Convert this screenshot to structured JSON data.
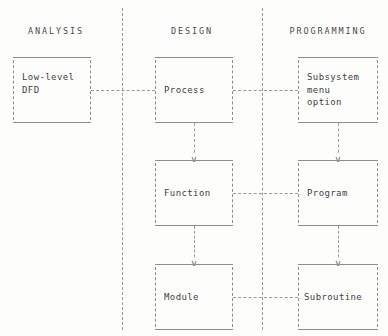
{
  "diagram": {
    "style": "ascii-art",
    "colors": {
      "background": "#fdfdfc",
      "line": "#8d8d8d",
      "dash": "#9a9a9a",
      "text": "#3f3f3f",
      "heading": "#4c4c4c"
    },
    "columns": [
      {
        "id": "analysis",
        "heading": "ANALYSIS"
      },
      {
        "id": "design",
        "heading": "DESIGN"
      },
      {
        "id": "programming",
        "heading": "PROGRAMMING"
      }
    ],
    "boxes": [
      {
        "id": "low-level-dfd",
        "column": "analysis",
        "row": 1,
        "text": "Low-level\nDFD"
      },
      {
        "id": "process",
        "column": "design",
        "row": 1,
        "text": "Process"
      },
      {
        "id": "subsystem-menu",
        "column": "programming",
        "row": 1,
        "text": "Subsystem\nmenu\noption"
      },
      {
        "id": "function",
        "column": "design",
        "row": 2,
        "text": "Function"
      },
      {
        "id": "program",
        "column": "programming",
        "row": 2,
        "text": "Program"
      },
      {
        "id": "module",
        "column": "design",
        "row": 3,
        "text": "Module"
      },
      {
        "id": "subroutine",
        "column": "programming",
        "row": 3,
        "text": "Subroutine"
      }
    ],
    "arrow_glyph": "v",
    "horizontal_links": [
      {
        "id": "dfd-to-process",
        "from": "low-level-dfd",
        "to": "process"
      },
      {
        "id": "process-to-subsystem",
        "from": "process",
        "to": "subsystem-menu"
      },
      {
        "id": "function-to-program",
        "from": "function",
        "to": "program"
      },
      {
        "id": "module-to-subroutine",
        "from": "module",
        "to": "subroutine"
      }
    ],
    "vertical_links": [
      {
        "id": "process-to-function",
        "from": "process",
        "to": "function"
      },
      {
        "id": "function-to-module",
        "from": "function",
        "to": "module"
      },
      {
        "id": "subsystem-to-program",
        "from": "subsystem-menu",
        "to": "program"
      },
      {
        "id": "program-to-subroutine",
        "from": "program",
        "to": "subroutine"
      }
    ]
  }
}
